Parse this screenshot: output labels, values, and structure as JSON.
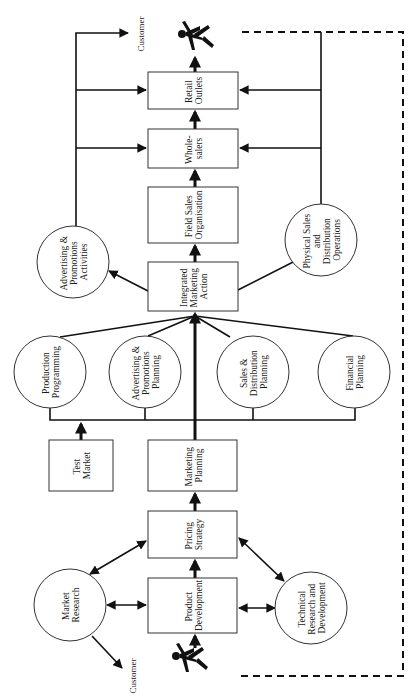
{
  "diagram": {
    "orientation": "rotated 90 degrees counter-clockwise (text reads bottom-to-top)",
    "boxes": {
      "retail_outlets": [
        "Retail",
        "Outlets"
      ],
      "wholesalers": [
        "Whole-",
        "salers"
      ],
      "field_sales": [
        "Field Sales",
        "Organisation"
      ],
      "integrated_marketing": [
        "Integrated",
        "Marketing",
        "Action"
      ],
      "test_market": [
        "Test",
        "Market"
      ],
      "marketing_planning": [
        "Marketing",
        "Planning"
      ],
      "pricing_strategy": [
        "Pricing",
        "Strategy"
      ],
      "product_development": [
        "Product",
        "Development"
      ]
    },
    "circles": {
      "adv_promo_activities": [
        "Advertising &",
        "Promotions",
        "Activities"
      ],
      "physical_sales": [
        "Physical Sales",
        "and",
        "Distribution",
        "Operations"
      ],
      "production_programming": [
        "Production",
        "Programming"
      ],
      "adv_promo_planning": [
        "Advertising &",
        "Promotions",
        "Planning"
      ],
      "sales_distribution_planning": [
        "Sales &",
        "Distribution",
        "Planning"
      ],
      "financial_planning": [
        "Financial",
        "Planning"
      ],
      "market_research": [
        "Market",
        "Research"
      ],
      "technical_rd": [
        "Technical",
        "Research and",
        "Development"
      ]
    },
    "labels": {
      "customer_top": "Customer",
      "customer_bottom": "Customer"
    },
    "icons": {
      "customer_figure_top": "running-person-icon",
      "customer_figure_bottom": "running-person-icon"
    },
    "colors": {
      "line": "#111111",
      "background": "#ffffff"
    }
  }
}
